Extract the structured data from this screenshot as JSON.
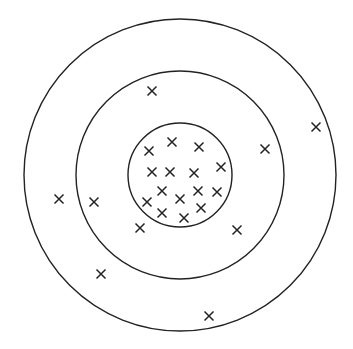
{
  "diagram": {
    "type": "concentric-circles-scatter",
    "stroke_color": "#222222",
    "background": "#ffffff",
    "center": [
      180,
      175
    ],
    "circles": [
      {
        "name": "outer-circle",
        "r": 156
      },
      {
        "name": "middle-circle",
        "r": 104
      },
      {
        "name": "inner-circle",
        "r": 52
      }
    ],
    "marker": "x",
    "points": [
      [
        152,
        91
      ],
      [
        316,
        127
      ],
      [
        265,
        149
      ],
      [
        149,
        151
      ],
      [
        172,
        142
      ],
      [
        199,
        147
      ],
      [
        221,
        167
      ],
      [
        152,
        172
      ],
      [
        170,
        172
      ],
      [
        194,
        173
      ],
      [
        162,
        191
      ],
      [
        198,
        191
      ],
      [
        217,
        192
      ],
      [
        147,
        202
      ],
      [
        180,
        199
      ],
      [
        162,
        213
      ],
      [
        201,
        208
      ],
      [
        184,
        218
      ],
      [
        140,
        228
      ],
      [
        237,
        230
      ],
      [
        59,
        199
      ],
      [
        94,
        202
      ],
      [
        101,
        274
      ],
      [
        209,
        316
      ]
    ]
  }
}
